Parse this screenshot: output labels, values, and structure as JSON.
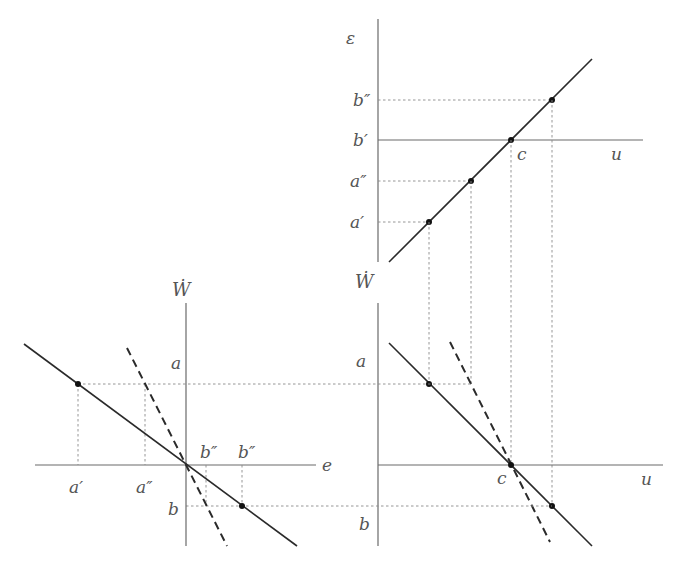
{
  "diagram": {
    "top_right": {
      "y_axis_label": "ε",
      "x_axis_label": "u",
      "y_ticks": [
        "b″",
        "b′",
        "a″",
        "a′"
      ],
      "point_label": "c"
    },
    "bottom_right": {
      "y_axis_label": "Ẇ",
      "x_axis_label": "u",
      "y_ticks": [
        "a",
        "b"
      ],
      "point_label": "c"
    },
    "bottom_left": {
      "y_axis_label": "Ẇ",
      "x_axis_label": "e",
      "y_ticks": [
        "a",
        "b"
      ],
      "x_ticks": [
        "a′",
        "a″",
        "b″",
        "b″"
      ]
    },
    "colors": {
      "axis": "#6a6a6a",
      "line": "#2a2a2a",
      "guide": "#8a8a8a",
      "label": "#555555"
    }
  }
}
